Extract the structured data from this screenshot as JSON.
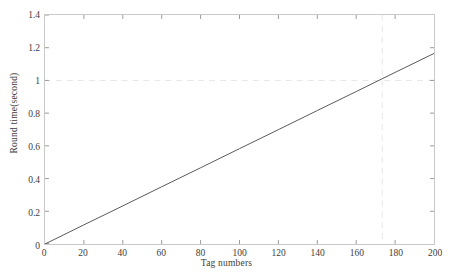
{
  "chart_data": {
    "type": "line",
    "title": "",
    "xlabel": "Tag numbers",
    "ylabel": "Round time(second)",
    "xlim": [
      0,
      200
    ],
    "ylim": [
      0,
      1.4
    ],
    "xticks": [
      0,
      20,
      40,
      60,
      80,
      100,
      120,
      140,
      160,
      180,
      200
    ],
    "xtick_labels": [
      "0",
      "20",
      "40",
      "60",
      "80",
      "100",
      "120",
      "140",
      "160",
      "180",
      "200"
    ],
    "yticks": [
      0,
      0.2,
      0.4,
      0.6,
      0.8,
      1,
      1.2,
      1.4
    ],
    "ytick_labels": [
      "0",
      "0.2",
      "0.4",
      "0.6",
      "0.8",
      "1",
      "1.2",
      "1.4"
    ],
    "grid": false,
    "legend": null,
    "line_color": "#595959",
    "frame_color": "#c9c9c9",
    "series": [
      {
        "name": "Round time",
        "x": [
          0,
          20,
          40,
          60,
          80,
          100,
          120,
          140,
          160,
          180,
          200
        ],
        "values": [
          0,
          0.117,
          0.233,
          0.35,
          0.466,
          0.583,
          0.699,
          0.816,
          0.932,
          1.049,
          1.165
        ]
      }
    ],
    "reference_lines": [
      {
        "name": "horizontal-reference-1s",
        "orientation": "horizontal",
        "value": 1.0,
        "style": "dashed",
        "color": "#e6e6e6"
      },
      {
        "name": "vertical-reference-170",
        "orientation": "vertical",
        "value": 170,
        "style": "dashed",
        "color": "#e8e8e8"
      }
    ]
  }
}
